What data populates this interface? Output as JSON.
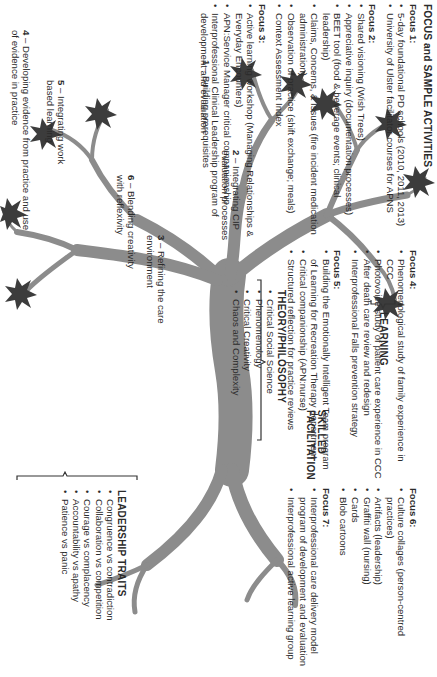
{
  "figure": {
    "orientation": "rotated 90 degrees clockwise",
    "colors": {
      "trunk": "#8c8c8c",
      "leaf": "#3c3c3c",
      "text": "#2b2b2b",
      "bracket": "#333333"
    }
  },
  "focus_panel": {
    "title": "FOCUS and SAMPLE ACTIVITIES",
    "focuses": [
      {
        "label": "Focus 1:",
        "items": [
          "5-day foundational PD schools (2010, 2011, 2013)",
          "University of Ulster facilitator courses for APNS"
        ]
      },
      {
        "label": "Focus 2:",
        "items": [
          "Shared visioning (Wish Trees)",
          "Appreciative inquiry (documentation processes)",
          "BEET tool (food & beverage events; clinical leadership)",
          "Claims, Concerns, & Issues (fire incident medication administration)",
          "Observation of practice (shift exchange; meals)",
          "Context Assessment Index"
        ]
      },
      {
        "label": "Focus 3:",
        "items": [
          "Active learning workshop (Managing Relationships & Everyday Encounters)",
          "APN:Service Manager critical companionship",
          "Interprofessional Clinical Leadership program of development and evaluation"
        ]
      },
      {
        "label": "Focus 4:",
        "items": [
          "Phenomenological study of family experience in CCC",
          "Photovoice study of patient care experience in CCC",
          "After death care review and redesign",
          "Interprofessional Falls prevention strategy"
        ]
      },
      {
        "label": "Focus 5:",
        "items": [
          "Building the Emotionally Intelligent Team program of Learning for Recreation Therapy department",
          "Critical companionship (APN:nurse)",
          "Structured reflection for practice reviews"
        ]
      },
      {
        "label": "Focus 6:",
        "items": [
          "Culture collages (person-centred practices)",
          "Artifacts (leadership)",
          "Graffiti wall (nursing)",
          "Cards",
          "Blob cartoons"
        ]
      },
      {
        "label": "Focus 7:",
        "items": [
          "Interprofessional care delivery model program of development and evaluation",
          "Interprofessional active learning group"
        ]
      }
    ]
  },
  "tree": {
    "branch_labels": [
      {
        "num": "1",
        "text": "– Building prerequisites"
      },
      {
        "num": "2",
        "text": "– Integrating CIP evaluation processes"
      },
      {
        "num": "3",
        "text": "– Refining the care environment"
      },
      {
        "num": "4",
        "text": "– Developing evidence from practice and use of evidence in practice"
      },
      {
        "num": "5",
        "text": "– Integrating work based learning"
      },
      {
        "num": "6",
        "text": "– Blending creativity with reflexivity"
      }
    ],
    "learning": "LEARNING",
    "skilled_facilitation": "SKILLED FACILITATION",
    "theory": {
      "title": "THEORY/PHILOSOPHY",
      "items": [
        "Critical Social Science",
        "Phenomenology",
        "Critical Creativity",
        "Chaos and Complexity"
      ]
    },
    "leadership": {
      "title": "LEADERSHIP TRAITS",
      "items": [
        "Congruence vs contradiction",
        "Collaboration vs competition",
        "Courage vs complacency",
        "Accountability vs apathy",
        "Patience vs panic"
      ]
    }
  }
}
